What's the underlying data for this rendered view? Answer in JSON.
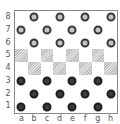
{
  "game": "checkers",
  "board": {
    "ranks": [
      "8",
      "7",
      "6",
      "5",
      "4",
      "3",
      "2",
      "1"
    ],
    "files": [
      "a",
      "b",
      "c",
      "d",
      "e",
      "f",
      "g",
      "h"
    ],
    "rows": [
      [
        "",
        "light",
        "",
        "light",
        "",
        "light",
        "",
        "light"
      ],
      [
        "light",
        "",
        "light",
        "",
        "light",
        "",
        "light",
        ""
      ],
      [
        "",
        "light",
        "",
        "light",
        "",
        "light",
        "",
        "light"
      ],
      [
        "dark_sq",
        "",
        "dark_sq",
        "",
        "dark_sq",
        "",
        "dark_sq",
        ""
      ],
      [
        "",
        "dark_sq",
        "",
        "dark_sq",
        "",
        "dark_sq",
        "",
        "dark_sq"
      ],
      [
        "dark",
        "",
        "dark",
        "",
        "dark",
        "",
        "dark",
        ""
      ],
      [
        "",
        "dark",
        "",
        "dark",
        "",
        "dark",
        "",
        "dark"
      ],
      [
        "dark",
        "",
        "dark",
        "",
        "dark",
        "",
        "dark",
        ""
      ]
    ]
  },
  "pieces": {
    "light_count": 12,
    "dark_count": 12
  },
  "colors": {
    "light_piece_fill": "#c4c4c4",
    "light_piece_stroke": "#3a3a3a",
    "dark_piece_fill": "#3c3c3c",
    "dark_piece_stroke": "#1e1e1e",
    "border": "#8a8a8a"
  }
}
